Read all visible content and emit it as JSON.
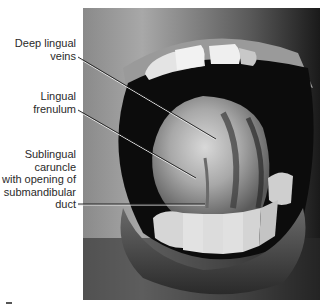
{
  "figure": {
    "type": "anatomical photograph",
    "labels": [
      {
        "id": "deep-lingual-veins",
        "lines": [
          "Deep lingual",
          "veins"
        ],
        "leader": {
          "x1": 78,
          "y1": 57,
          "x2": 216,
          "y2": 139
        }
      },
      {
        "id": "lingual-frenulum",
        "lines": [
          "Lingual",
          "frenulum"
        ],
        "leader": {
          "x1": 78,
          "y1": 110,
          "x2": 196,
          "y2": 178
        }
      },
      {
        "id": "sublingual-caruncle",
        "lines": [
          "Sublingual",
          "caruncle",
          "with opening of",
          "submandibular",
          "duct"
        ],
        "leader": {
          "x1": 78,
          "y1": 204,
          "x2": 205,
          "y2": 204
        }
      }
    ],
    "colors": {
      "text": "#2a2a2a",
      "leader_line": "#1a1a1a",
      "leader_highlight": "#e8e8e8",
      "background": "#ffffff"
    }
  }
}
